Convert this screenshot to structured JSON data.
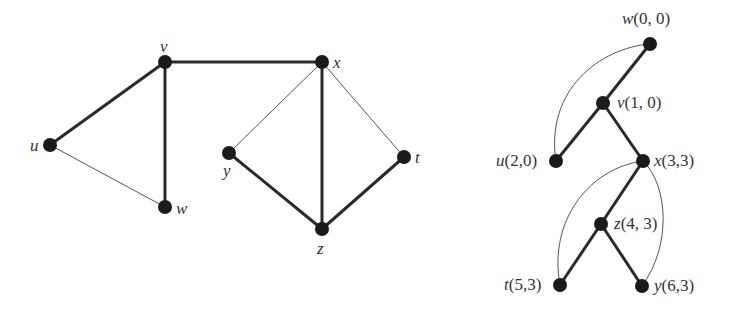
{
  "left_graph": {
    "nodes": [
      {
        "id": "v",
        "label": "v",
        "x": 165,
        "y": 62,
        "lx": 160,
        "ly": 38
      },
      {
        "id": "x",
        "label": "x",
        "x": 322,
        "y": 62,
        "lx": 333,
        "ly": 54
      },
      {
        "id": "u",
        "label": "u",
        "x": 50,
        "y": 145,
        "lx": 30,
        "ly": 137
      },
      {
        "id": "w",
        "label": "w",
        "x": 165,
        "y": 207,
        "lx": 176,
        "ly": 200
      },
      {
        "id": "y",
        "label": "y",
        "x": 229,
        "y": 153,
        "lx": 223,
        "ly": 162
      },
      {
        "id": "z",
        "label": "z",
        "x": 322,
        "y": 229,
        "lx": 317,
        "ly": 240
      },
      {
        "id": "t",
        "label": "t",
        "x": 404,
        "y": 157,
        "lx": 415,
        "ly": 149
      }
    ],
    "edges": [
      {
        "from": "v",
        "to": "x",
        "type": "tree"
      },
      {
        "from": "u",
        "to": "v",
        "type": "tree"
      },
      {
        "from": "v",
        "to": "w",
        "type": "tree"
      },
      {
        "from": "u",
        "to": "w",
        "type": "back"
      },
      {
        "from": "x",
        "to": "y",
        "type": "back"
      },
      {
        "from": "x",
        "to": "z",
        "type": "tree"
      },
      {
        "from": "x",
        "to": "t",
        "type": "back"
      },
      {
        "from": "y",
        "to": "z",
        "type": "tree"
      },
      {
        "from": "z",
        "to": "t",
        "type": "tree"
      }
    ]
  },
  "right_tree": {
    "nodes": [
      {
        "id": "w",
        "name": "w",
        "coords": "(0, 0)",
        "x": 650,
        "y": 44,
        "lx": 622,
        "ly": 10
      },
      {
        "id": "v",
        "name": "v",
        "coords": "(1, 0)",
        "x": 603,
        "y": 103,
        "lx": 617,
        "ly": 94
      },
      {
        "id": "u",
        "name": "u",
        "coords": "(2,0)",
        "x": 556,
        "y": 161,
        "lx": 496,
        "ly": 152
      },
      {
        "id": "x",
        "name": "x",
        "coords": "(3,3)",
        "x": 643,
        "y": 161,
        "lx": 654,
        "ly": 152
      },
      {
        "id": "z",
        "name": "z",
        "coords": "(4, 3)",
        "x": 601,
        "y": 224,
        "lx": 614,
        "ly": 215
      },
      {
        "id": "t",
        "name": "t",
        "coords": "(5,3)",
        "x": 560,
        "y": 285,
        "lx": 504,
        "ly": 276
      },
      {
        "id": "y",
        "name": "y",
        "coords": "(6,3)",
        "x": 642,
        "y": 286,
        "lx": 654,
        "ly": 277
      }
    ],
    "tree_edges": [
      {
        "from": "w",
        "to": "v"
      },
      {
        "from": "v",
        "to": "u"
      },
      {
        "from": "v",
        "to": "x"
      },
      {
        "from": "x",
        "to": "z"
      },
      {
        "from": "z",
        "to": "t"
      },
      {
        "from": "z",
        "to": "y"
      }
    ],
    "back_edges": [
      {
        "from": "u",
        "to": "w",
        "path": "M556,161 C545,90 600,48 650,44"
      },
      {
        "from": "t",
        "to": "x",
        "path": "M560,285 C548,220 590,168 643,161"
      },
      {
        "from": "y",
        "to": "x",
        "path": "M642,286 C672,245 668,185 643,161"
      }
    ]
  },
  "style": {
    "node_color": "#1a1a1a",
    "tree_edge_color": "#2a2a2a",
    "back_edge_color": "#555555",
    "tree_edge_width": 3,
    "back_edge_width": 1,
    "node_radius": 7
  }
}
